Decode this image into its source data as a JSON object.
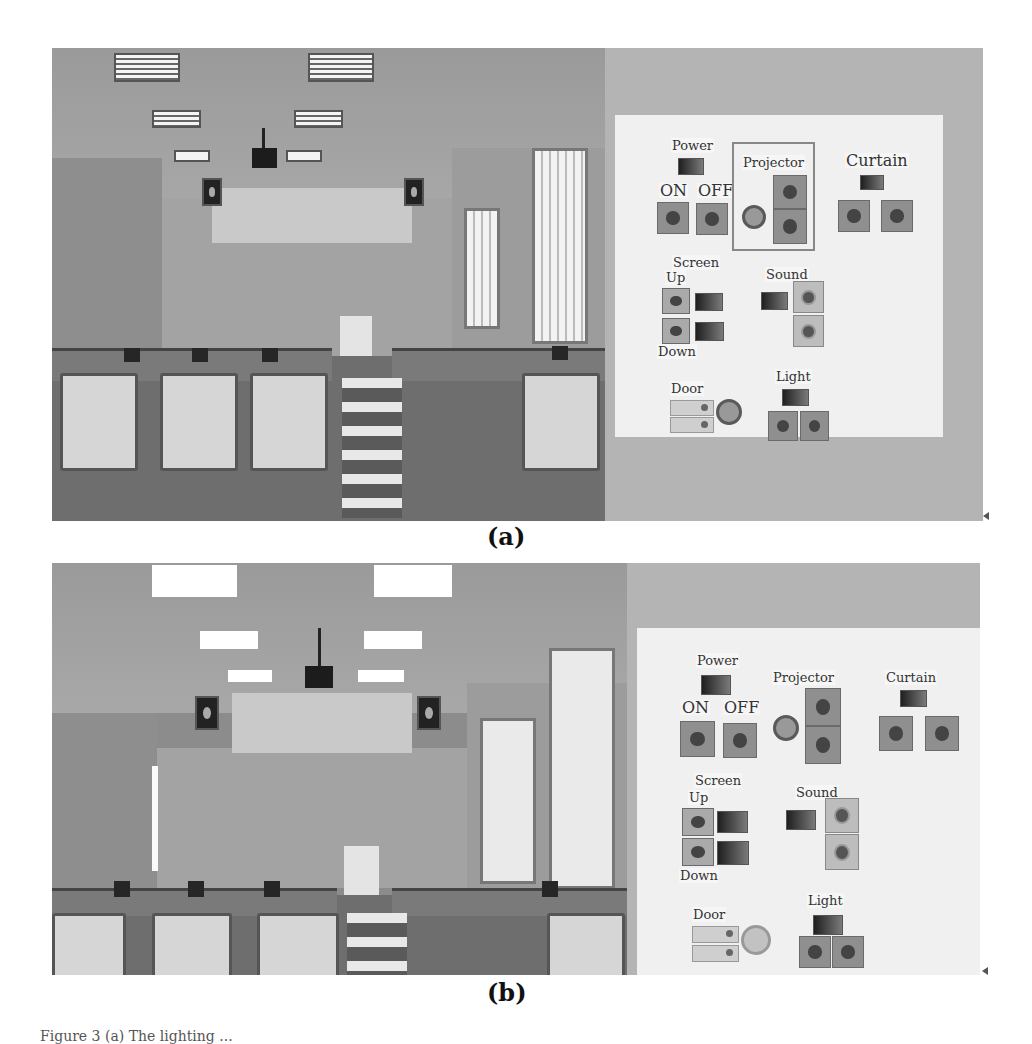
{
  "figure": {
    "caption_partial": "Figure 3 (a) The lighting ...",
    "subfigures": [
      {
        "label": "(a)",
        "state": "lights on, blinds open",
        "control_panel": {
          "groups": [
            {
              "title": "Power",
              "controls": [
                {
                  "label": "ON",
                  "type": "button"
                },
                {
                  "label": "OFF",
                  "type": "button"
                }
              ],
              "indicator": "power-indicator"
            },
            {
              "title": "Projector",
              "controls": [
                {
                  "label": "",
                  "type": "knob"
                },
                {
                  "label": "",
                  "type": "button"
                },
                {
                  "label": "",
                  "type": "button"
                }
              ],
              "boxed": true
            },
            {
              "title": "Curtain",
              "controls": [
                {
                  "label": "",
                  "type": "button"
                },
                {
                  "label": "",
                  "type": "button"
                }
              ],
              "indicator": "curtain-indicator"
            },
            {
              "title": "Screen",
              "controls": [
                {
                  "label": "Up",
                  "type": "button"
                },
                {
                  "label": "Down",
                  "type": "button"
                }
              ]
            },
            {
              "title": "Sound",
              "controls": [
                {
                  "label": "",
                  "type": "round-button"
                },
                {
                  "label": "",
                  "type": "round-button"
                }
              ]
            },
            {
              "title": "Door",
              "controls": [
                {
                  "label": "",
                  "type": "switch"
                },
                {
                  "label": "",
                  "type": "switch"
                },
                {
                  "label": "",
                  "type": "knob"
                }
              ]
            },
            {
              "title": "Light",
              "controls": [
                {
                  "label": "",
                  "type": "button"
                },
                {
                  "label": "",
                  "type": "button"
                }
              ],
              "indicator": "light-indicator"
            }
          ]
        }
      },
      {
        "label": "(b)",
        "state": "lights on, curtains closed",
        "control_panel": {
          "groups": [
            {
              "title": "Power",
              "controls": [
                {
                  "label": "ON",
                  "type": "button"
                },
                {
                  "label": "OFF",
                  "type": "button"
                }
              ]
            },
            {
              "title": "Projector",
              "controls": [
                {
                  "label": "",
                  "type": "knob"
                },
                {
                  "label": "",
                  "type": "button"
                },
                {
                  "label": "",
                  "type": "button"
                }
              ],
              "boxed": false
            },
            {
              "title": "Curtain",
              "controls": [
                {
                  "label": "",
                  "type": "button"
                },
                {
                  "label": "",
                  "type": "button"
                }
              ]
            },
            {
              "title": "Screen",
              "controls": [
                {
                  "label": "Up",
                  "type": "button"
                },
                {
                  "label": "Down",
                  "type": "button"
                }
              ]
            },
            {
              "title": "Sound",
              "controls": [
                {
                  "label": "",
                  "type": "round-button"
                },
                {
                  "label": "",
                  "type": "round-button"
                }
              ]
            },
            {
              "title": "Door",
              "controls": [
                {
                  "label": "",
                  "type": "switch"
                },
                {
                  "label": "",
                  "type": "switch"
                },
                {
                  "label": "",
                  "type": "knob"
                }
              ]
            },
            {
              "title": "Light",
              "controls": [
                {
                  "label": "",
                  "type": "button"
                },
                {
                  "label": "",
                  "type": "button"
                }
              ]
            }
          ]
        }
      }
    ]
  },
  "labels": {
    "power": "Power",
    "on": "ON",
    "off": "OFF",
    "projector": "Projector",
    "curtain": "Curtain",
    "screen": "Screen",
    "up": "Up",
    "down": "Down",
    "sound": "Sound",
    "door": "Door",
    "light": "Light"
  },
  "colors": {
    "page_bg": "#ffffff",
    "control_panel_bg": "#f0f0f0",
    "button_gray": "#8f8f8f",
    "scene_gray": "#8a8a8a"
  }
}
